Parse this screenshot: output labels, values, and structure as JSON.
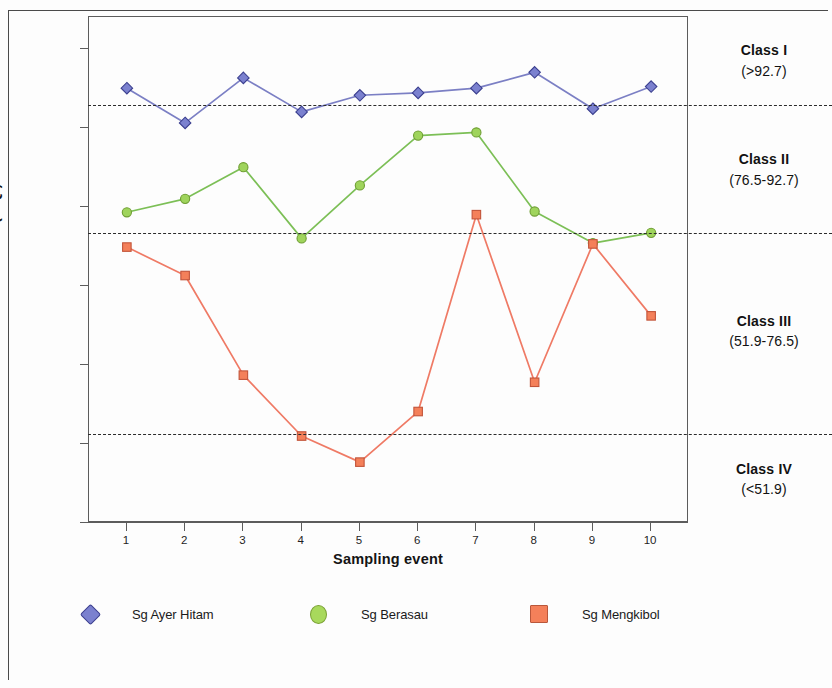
{
  "chart_data": {
    "type": "line",
    "title": "",
    "xlabel": "Sampling event",
    "ylabel": "Mean (WQI)",
    "x": [
      1,
      2,
      3,
      4,
      5,
      6,
      7,
      8,
      9,
      10
    ],
    "xtick_labels": [
      "1",
      "2",
      "3",
      "4",
      "5",
      "6",
      "7",
      "8",
      "9",
      "10"
    ],
    "ytick_labels": [
      "100.00",
      "90.00",
      "80.00",
      "70.00",
      "60.00",
      "50.00",
      "40.00"
    ],
    "ytick_values": [
      100,
      90,
      80,
      70,
      60,
      50,
      40
    ],
    "ylim": [
      40,
      104
    ],
    "xlim": [
      0.35,
      10.65
    ],
    "grid": false,
    "legend_position": "bottom",
    "series": [
      {
        "name": "Sg Ayer Hitam",
        "marker": "diamond",
        "color": "#7b7fc4",
        "marker_fill": "#7b81cf",
        "marker_edge": "#3b3f8f",
        "values": [
          95.0,
          90.6,
          96.3,
          92.0,
          94.1,
          94.4,
          95.0,
          97.0,
          92.4,
          95.2
        ]
      },
      {
        "name": "Sg Berasau",
        "marker": "circle",
        "color": "#7cbf56",
        "marker_fill": "#9fd45c",
        "marker_edge": "#6f9e33",
        "values": [
          79.3,
          81.0,
          85.0,
          76.0,
          82.7,
          89.0,
          89.4,
          79.4,
          75.4,
          76.7
        ]
      },
      {
        "name": "Sg Mengkibol",
        "marker": "square",
        "color": "#ef7a65",
        "marker_fill": "#f4805a",
        "marker_edge": "#c2543a",
        "values": [
          74.9,
          71.3,
          58.7,
          51.0,
          47.7,
          54.1,
          79.0,
          57.8,
          75.3,
          66.2
        ]
      }
    ],
    "thresholds": [
      {
        "value": 92.7,
        "style": "dashed",
        "color": "#2b2b2b"
      },
      {
        "value": 76.5,
        "style": "dashed",
        "color": "#2b2b2b"
      },
      {
        "value": 51.1,
        "style": "dashed",
        "color": "#2b2b2b"
      }
    ],
    "annotations": [
      {
        "name": "Class I",
        "range": "(>92.7)",
        "center_value": 98.4
      },
      {
        "name": "Class II",
        "range": "(76.5-92.7)",
        "center_value": 84.6
      },
      {
        "name": "Class III",
        "range": "(51.9-76.5)",
        "center_value": 64.2
      },
      {
        "name": "Class IV",
        "range": "(<51.9)",
        "center_value": 45.5
      }
    ]
  },
  "legend": {
    "items": [
      {
        "label": "Sg Ayer Hitam",
        "marker": "diamond",
        "fill": "#7b81cf",
        "edge": "#3b3f8f"
      },
      {
        "label": "Sg Berasau",
        "marker": "circle",
        "fill": "#a8d95c",
        "edge": "#7ba235"
      },
      {
        "label": "Sg Mengkibol",
        "marker": "square",
        "fill": "#f4805a",
        "edge": "#b9573b"
      }
    ]
  }
}
